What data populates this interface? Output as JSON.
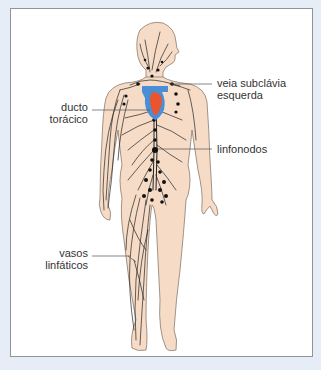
{
  "diagram": {
    "type": "anatomical-illustration",
    "colors": {
      "background": "#e6edf6",
      "panel": "#ffffff",
      "panel_border": "#8f949a",
      "skin": "#f6dcc6",
      "outline": "#8a7a6e",
      "lymph_vessels": "#222222",
      "heart_red": "#e8552e",
      "heart_blue": "#4a8fd6",
      "leader_line": "#555555",
      "text": "#333333"
    },
    "labels": {
      "subclavian_vein_line1": "veia subclávia",
      "subclavian_vein_line2": "esquerda",
      "thoracic_duct_line1": "ducto",
      "thoracic_duct_line2": "torácico",
      "lymph_nodes": "linfonodos",
      "lymph_vessels_line1": "vasos",
      "lymph_vessels_line2": "linfáticos"
    }
  }
}
